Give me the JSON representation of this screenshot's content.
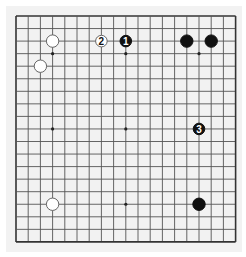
{
  "board": {
    "size": 19,
    "origin_x": 16,
    "origin_y": 16,
    "step_x": 12.2,
    "step_y": 12.55,
    "line_color": "#555555",
    "border_color": "#333333",
    "background": "#f2f2f2",
    "star_points": [
      [
        3,
        3
      ],
      [
        9,
        3
      ],
      [
        15,
        3
      ],
      [
        3,
        9
      ],
      [
        9,
        9
      ],
      [
        15,
        9
      ],
      [
        3,
        15
      ],
      [
        9,
        15
      ],
      [
        15,
        15
      ]
    ],
    "stones": [
      {
        "color": "white",
        "x": 3,
        "y": 2,
        "label": ""
      },
      {
        "color": "white",
        "x": 2,
        "y": 4,
        "label": ""
      },
      {
        "color": "white",
        "x": 7,
        "y": 2,
        "label": "2"
      },
      {
        "color": "black",
        "x": 9,
        "y": 2,
        "label": "1"
      },
      {
        "color": "black",
        "x": 14,
        "y": 2,
        "label": ""
      },
      {
        "color": "black",
        "x": 16,
        "y": 2,
        "label": ""
      },
      {
        "color": "black",
        "x": 15,
        "y": 9,
        "label": "3"
      },
      {
        "color": "white",
        "x": 3,
        "y": 15,
        "label": ""
      },
      {
        "color": "black",
        "x": 15,
        "y": 15,
        "label": ""
      }
    ]
  }
}
